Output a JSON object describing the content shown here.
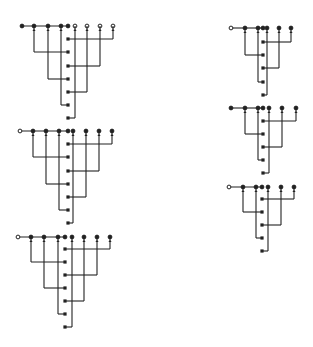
{
  "diagram_data": {
    "type": "wiring-tree-figures",
    "stroke_color": "#222222",
    "background": "#ffffff",
    "figures": [
      {
        "id": "fig-left-1",
        "top_y": 26,
        "branch_y": 39,
        "left_nodes": [
          22,
          34,
          48,
          61
        ],
        "left_node_first_open": false,
        "junction_x": 68,
        "trunk_x": 75,
        "right_nodes": [
          75,
          87,
          100,
          113
        ],
        "right_nodes_open": true,
        "left_drops": [
          {
            "x": 34,
            "y": 52
          },
          {
            "x": 48,
            "y": 79
          },
          {
            "x": 61,
            "y": 105
          }
        ],
        "right_drops": [
          {
            "x": 113,
            "y": 39
          },
          {
            "x": 100,
            "y": 66
          },
          {
            "x": 87,
            "y": 92
          }
        ],
        "outputs_y": [
          39,
          52,
          66,
          79,
          92,
          105,
          118
        ],
        "trunk_end_y": 118
      },
      {
        "id": "fig-left-2",
        "top_y": 131,
        "branch_y": 144,
        "left_nodes": [
          20,
          33,
          46,
          59
        ],
        "left_node_first_open": true,
        "junction_x": 68,
        "trunk_x": 73,
        "right_nodes": [
          73,
          86,
          99,
          112
        ],
        "right_nodes_open": false,
        "left_drops": [
          {
            "x": 33,
            "y": 157
          },
          {
            "x": 46,
            "y": 184
          },
          {
            "x": 59,
            "y": 210
          }
        ],
        "right_drops": [
          {
            "x": 112,
            "y": 144
          },
          {
            "x": 99,
            "y": 171
          },
          {
            "x": 86,
            "y": 197
          }
        ],
        "outputs_y": [
          144,
          157,
          171,
          184,
          197,
          210,
          223
        ],
        "trunk_end_y": 223
      },
      {
        "id": "fig-left-3",
        "top_y": 237,
        "branch_y": 249,
        "left_nodes": [
          18,
          31,
          44,
          58
        ],
        "left_node_first_open": true,
        "junction_x": 65,
        "trunk_x": 72,
        "right_nodes": [
          72,
          84,
          97,
          110
        ],
        "right_nodes_open": false,
        "left_drops": [
          {
            "x": 31,
            "y": 262
          },
          {
            "x": 44,
            "y": 288
          },
          {
            "x": 58,
            "y": 314
          }
        ],
        "right_drops": [
          {
            "x": 110,
            "y": 249
          },
          {
            "x": 97,
            "y": 275
          },
          {
            "x": 84,
            "y": 301
          }
        ],
        "outputs_y": [
          249,
          262,
          275,
          288,
          301,
          314,
          327
        ],
        "trunk_end_y": 327
      },
      {
        "id": "fig-right-1",
        "top_y": 28,
        "branch_y": 42,
        "left_nodes": [
          231,
          245,
          258
        ],
        "left_node_first_open": true,
        "junction_x": 263,
        "trunk_x": 267,
        "right_nodes": [
          267,
          279,
          291
        ],
        "right_nodes_open": false,
        "left_drops": [
          {
            "x": 245,
            "y": 55
          },
          {
            "x": 258,
            "y": 82
          }
        ],
        "right_drops": [
          {
            "x": 291,
            "y": 42
          },
          {
            "x": 279,
            "y": 68
          }
        ],
        "outputs_y": [
          42,
          55,
          68,
          82,
          95
        ],
        "trunk_end_y": 95
      },
      {
        "id": "fig-right-2",
        "top_y": 108,
        "branch_y": 121,
        "left_nodes": [
          231,
          245,
          258
        ],
        "left_node_first_open": false,
        "junction_x": 263,
        "trunk_x": 269,
        "right_nodes": [
          269,
          282,
          296
        ],
        "right_nodes_open": false,
        "left_drops": [
          {
            "x": 245,
            "y": 134
          },
          {
            "x": 258,
            "y": 160
          }
        ],
        "right_drops": [
          {
            "x": 296,
            "y": 121
          },
          {
            "x": 282,
            "y": 147
          }
        ],
        "outputs_y": [
          121,
          134,
          147,
          160,
          173
        ],
        "trunk_end_y": 173
      },
      {
        "id": "fig-right-3",
        "top_y": 187,
        "branch_y": 199,
        "left_nodes": [
          229,
          243,
          256
        ],
        "left_node_first_open": true,
        "junction_x": 262,
        "trunk_x": 268,
        "right_nodes": [
          268,
          281,
          294
        ],
        "right_nodes_open": false,
        "left_drops": [
          {
            "x": 243,
            "y": 212
          },
          {
            "x": 256,
            "y": 238
          }
        ],
        "right_drops": [
          {
            "x": 294,
            "y": 199
          },
          {
            "x": 281,
            "y": 225
          }
        ],
        "outputs_y": [
          199,
          212,
          225,
          238,
          251
        ],
        "trunk_end_y": 251
      }
    ]
  }
}
